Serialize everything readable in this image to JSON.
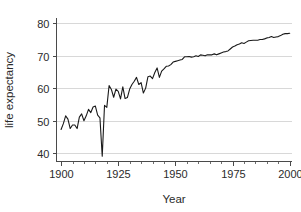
{
  "chart_data": {
    "type": "line",
    "title": "",
    "xlabel": "Year",
    "ylabel": "life expectancy",
    "xlim": [
      1898,
      2001
    ],
    "ylim": [
      37.5,
      81.5
    ],
    "xticks": [
      1900,
      1925,
      1950,
      1975,
      2000
    ],
    "xtick_labels": [
      "1900",
      "1925",
      "1950",
      "1975",
      "2000"
    ],
    "xminor_step": 5,
    "yticks": [
      40,
      50,
      60,
      70,
      80
    ],
    "ytick_labels": [
      "40",
      "50",
      "60",
      "70",
      "80"
    ],
    "grid": "horizontal-major",
    "legend": "none",
    "line_color": "#1a1a1a",
    "grid_color": "#d8d8d8",
    "axis_color": "#4a4a4a",
    "series": [
      {
        "name": "life expectancy",
        "x": [
          1900,
          1901,
          1902,
          1903,
          1904,
          1905,
          1906,
          1907,
          1908,
          1909,
          1910,
          1911,
          1912,
          1913,
          1914,
          1915,
          1916,
          1917,
          1918,
          1919,
          1920,
          1921,
          1922,
          1923,
          1924,
          1925,
          1926,
          1927,
          1928,
          1929,
          1930,
          1931,
          1932,
          1933,
          1934,
          1935,
          1936,
          1937,
          1938,
          1939,
          1940,
          1941,
          1942,
          1943,
          1944,
          1945,
          1946,
          1947,
          1948,
          1949,
          1950,
          1951,
          1952,
          1953,
          1954,
          1955,
          1956,
          1957,
          1958,
          1959,
          1960,
          1961,
          1962,
          1963,
          1964,
          1965,
          1966,
          1967,
          1968,
          1969,
          1970,
          1971,
          1972,
          1973,
          1974,
          1975,
          1976,
          1977,
          1978,
          1979,
          1980,
          1981,
          1982,
          1983,
          1984,
          1985,
          1986,
          1987,
          1988,
          1989,
          1990,
          1991,
          1992,
          1993,
          1994,
          1995,
          1996,
          1997,
          1998,
          1999,
          2000
        ],
        "values": [
          47.3,
          49.1,
          51.5,
          50.5,
          47.6,
          48.7,
          48.7,
          47.6,
          51.1,
          52.1,
          50.0,
          51.5,
          53.5,
          52.5,
          54.2,
          54.5,
          51.7,
          50.9,
          39.1,
          54.7,
          54.1,
          60.8,
          59.6,
          57.2,
          59.7,
          59.0,
          56.7,
          60.4,
          56.8,
          57.1,
          59.7,
          61.1,
          62.1,
          63.3,
          61.1,
          61.7,
          58.5,
          60.0,
          63.5,
          63.7,
          62.9,
          64.8,
          66.2,
          63.3,
          65.2,
          65.9,
          66.7,
          66.8,
          67.2,
          68.0,
          68.2,
          68.4,
          68.6,
          68.8,
          69.6,
          69.6,
          69.7,
          69.5,
          69.6,
          69.9,
          69.7,
          70.2,
          70.1,
          69.9,
          70.2,
          70.2,
          70.2,
          70.5,
          70.2,
          70.5,
          70.8,
          71.1,
          71.2,
          71.4,
          72.0,
          72.6,
          72.9,
          73.3,
          73.5,
          73.9,
          73.7,
          74.1,
          74.5,
          74.6,
          74.7,
          74.7,
          74.7,
          74.9,
          74.9,
          75.1,
          75.4,
          75.5,
          75.8,
          75.5,
          75.7,
          75.8,
          76.1,
          76.5,
          76.7,
          76.7,
          76.8
        ]
      }
    ]
  },
  "figure": {
    "x_axis_title": "Year",
    "y_axis_title": "life expectancy"
  }
}
